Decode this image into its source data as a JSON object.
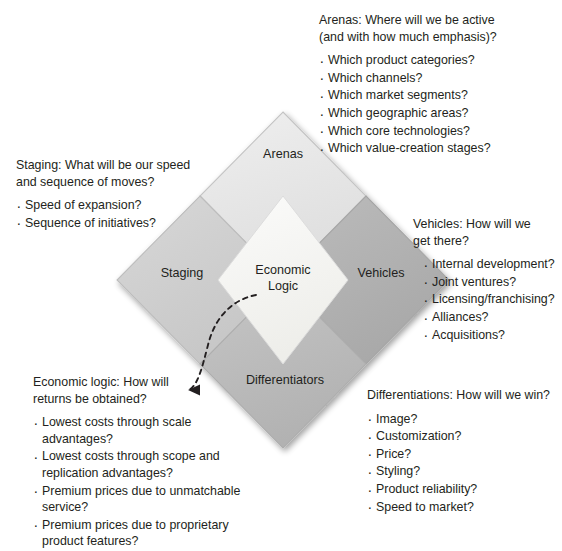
{
  "diagram": {
    "colors": {
      "arenas_fill": "#e7e7e7",
      "staging_fill": "#d0d0d0",
      "vehicles_fill": "#b3b3b3",
      "differentiators_fill": "#bdbdbd",
      "center_fill": "#f4f4f2",
      "stroke": "#b9b9b9",
      "text": "#231f20",
      "arrow": "#231f20",
      "background": "#ffffff"
    },
    "labels": {
      "arenas": "Arenas",
      "staging": "Staging",
      "vehicles": "Vehicles",
      "differentiators": "Differentiators",
      "economic_logic": "Economic\nLogic"
    },
    "connector": {
      "name": "dashed-arrow",
      "from": "Economic Logic center diamond",
      "to": "Economic logic question heading",
      "style": "dashed curved arrow pointing left"
    }
  },
  "blocks": {
    "arenas": {
      "heading": "Arenas: Where will we be active\n(and with how much emphasis)?",
      "items": [
        "Which product categories?",
        "Which channels?",
        "Which market segments?",
        "Which geographic areas?",
        "Which core technologies?",
        "Which value-creation stages?"
      ]
    },
    "staging": {
      "heading": "Staging: What will be our speed\nand sequence of moves?",
      "items": [
        "Speed of expansion?",
        "Sequence of initiatives?"
      ]
    },
    "vehicles": {
      "heading": "Vehicles: How will we\nget there?",
      "items": [
        "Internal development?",
        "Joint ventures?",
        "Licensing/franchising?",
        "Alliances?",
        "Acquisitions?"
      ]
    },
    "differentiations": {
      "heading": "Differentiations: How will we win?",
      "items": [
        "Image?",
        "Customization?",
        "Price?",
        "Styling?",
        "Product reliability?",
        "Speed to market?"
      ]
    },
    "economic_logic": {
      "heading": "Economic logic: How will\nreturns be obtained?",
      "items": [
        "Lowest costs through scale advantages?",
        "Lowest costs through scope and replication advantages?",
        "Premium prices due to unmatchable service?",
        "Premium prices due to proprietary product features?"
      ]
    }
  }
}
